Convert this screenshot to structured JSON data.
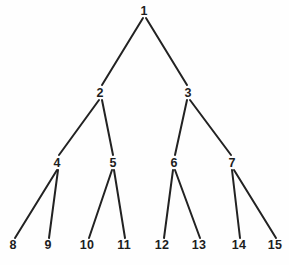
{
  "figure": {
    "name": "binary-tree-diagram",
    "type": "tree",
    "background_color": "#fefefe",
    "edge_color": "#222222",
    "label_color": "#1d1d1d",
    "width": 289,
    "height": 265
  },
  "chart_data": {
    "type": "diagram",
    "subtype": "complete-binary-tree",
    "title": "",
    "depth": 4,
    "node_count": 15,
    "nodes": [
      {
        "id": 1,
        "label": "1",
        "level": 0,
        "x": 144,
        "y": 11
      },
      {
        "id": 2,
        "label": "2",
        "level": 1,
        "x": 100,
        "y": 93
      },
      {
        "id": 3,
        "label": "3",
        "level": 1,
        "x": 188,
        "y": 93
      },
      {
        "id": 4,
        "label": "4",
        "level": 2,
        "x": 57,
        "y": 163
      },
      {
        "id": 5,
        "label": "5",
        "level": 2,
        "x": 113,
        "y": 163
      },
      {
        "id": 6,
        "label": "6",
        "level": 2,
        "x": 174,
        "y": 163
      },
      {
        "id": 7,
        "label": "7",
        "level": 2,
        "x": 232,
        "y": 163
      },
      {
        "id": 8,
        "label": "8",
        "level": 3,
        "x": 13,
        "y": 245
      },
      {
        "id": 9,
        "label": "9",
        "level": 3,
        "x": 48,
        "y": 245
      },
      {
        "id": 10,
        "label": "10",
        "level": 3,
        "x": 87,
        "y": 245
      },
      {
        "id": 11,
        "label": "11",
        "level": 3,
        "x": 124,
        "y": 245
      },
      {
        "id": 12,
        "label": "12",
        "level": 3,
        "x": 162,
        "y": 245
      },
      {
        "id": 13,
        "label": "13",
        "level": 3,
        "x": 199,
        "y": 245
      },
      {
        "id": 14,
        "label": "14",
        "level": 3,
        "x": 239,
        "y": 245
      },
      {
        "id": 15,
        "label": "15",
        "level": 3,
        "x": 275,
        "y": 245
      }
    ],
    "edges": [
      {
        "from": 1,
        "to": 2,
        "x1": 143,
        "y1": 18,
        "x2": 102,
        "y2": 85
      },
      {
        "from": 1,
        "to": 3,
        "x1": 146,
        "y1": 18,
        "x2": 187,
        "y2": 85
      },
      {
        "from": 2,
        "to": 4,
        "x1": 99,
        "y1": 100,
        "x2": 59,
        "y2": 155
      },
      {
        "from": 2,
        "to": 5,
        "x1": 102,
        "y1": 100,
        "x2": 113,
        "y2": 155
      },
      {
        "from": 3,
        "to": 6,
        "x1": 187,
        "y1": 100,
        "x2": 175,
        "y2": 155
      },
      {
        "from": 3,
        "to": 7,
        "x1": 190,
        "y1": 100,
        "x2": 231,
        "y2": 155
      },
      {
        "from": 4,
        "to": 8,
        "x1": 57,
        "y1": 170,
        "x2": 15,
        "y2": 238
      },
      {
        "from": 4,
        "to": 9,
        "x1": 58,
        "y1": 170,
        "x2": 49,
        "y2": 238
      },
      {
        "from": 5,
        "to": 10,
        "x1": 112,
        "y1": 170,
        "x2": 89,
        "y2": 238
      },
      {
        "from": 5,
        "to": 11,
        "x1": 114,
        "y1": 170,
        "x2": 125,
        "y2": 238
      },
      {
        "from": 6,
        "to": 12,
        "x1": 173,
        "y1": 170,
        "x2": 164,
        "y2": 238
      },
      {
        "from": 6,
        "to": 13,
        "x1": 175,
        "y1": 170,
        "x2": 200,
        "y2": 238
      },
      {
        "from": 7,
        "to": 14,
        "x1": 232,
        "y1": 170,
        "x2": 240,
        "y2": 238
      },
      {
        "from": 7,
        "to": 15,
        "x1": 234,
        "y1": 170,
        "x2": 276,
        "y2": 238
      }
    ]
  }
}
